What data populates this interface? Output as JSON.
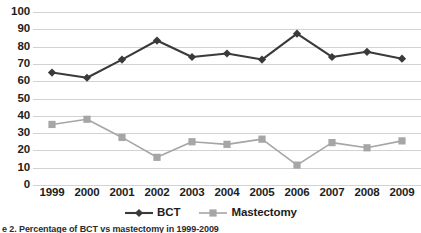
{
  "chart_data": {
    "type": "line",
    "title": "",
    "xlabel": "",
    "ylabel": "",
    "categories": [
      "1999",
      "2000",
      "2001",
      "2002",
      "2003",
      "2004",
      "2005",
      "2006",
      "2007",
      "2008",
      "2009"
    ],
    "series": [
      {
        "name": "BCT",
        "marker": "diamond",
        "color": "#3a3a3a",
        "values": [
          65,
          62,
          72.5,
          83.5,
          74,
          76,
          72.5,
          87.5,
          74,
          77,
          73
        ]
      },
      {
        "name": "Mastectomy",
        "marker": "square",
        "color": "#a6a6a6",
        "values": [
          35,
          38,
          27.5,
          16,
          25,
          23.5,
          26.5,
          11.5,
          24.5,
          21.5,
          25.5
        ]
      }
    ],
    "ylim": [
      0,
      100
    ],
    "ytick_values": [
      0,
      10,
      20,
      30,
      40,
      50,
      60,
      70,
      80,
      90,
      100
    ],
    "ytick_labels": [
      "0",
      "10",
      "20",
      "30",
      "40",
      "50",
      "60",
      "70",
      "80",
      "90",
      "100"
    ],
    "grid": true,
    "grid_color": "#d2d2d2",
    "legend_position": "bottom-center"
  },
  "caption": {
    "text": "e 2. Percentage of BCT vs mastectomy in 1999-2009"
  }
}
